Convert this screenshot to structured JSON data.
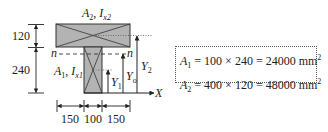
{
  "figure": {
    "title_top": {
      "A": "A",
      "A_sub": "2",
      "I": "I",
      "I_sub": "x2",
      "sep": ", "
    },
    "web_label": {
      "A": "A",
      "A_sub": "1",
      "I": "I",
      "I_sub": "x1",
      "sep": ", "
    },
    "neutral_axis_label": "n",
    "x_axis_label": "X",
    "y_labels": {
      "Y1": {
        "base": "Y",
        "sub": "1"
      },
      "Y0": {
        "base": "Y",
        "sub": "o"
      },
      "Y2": {
        "base": "Y",
        "sub": "2"
      }
    },
    "vertical_dimensions": [
      "120",
      "240"
    ],
    "horizontal_dimensions": [
      "150",
      "100",
      "150"
    ],
    "colors": {
      "fill": "#b3b3b3",
      "stroke": "#333333"
    }
  },
  "formulas": [
    {
      "lhs_base": "A",
      "lhs_sub": "1",
      "rhs": " = 100 × 240 = 24000 mm",
      "sup": "2"
    },
    {
      "lhs_base": "A",
      "lhs_sub": "2",
      "rhs": " = 400 × 120 = 48000 mm",
      "sup": "2"
    }
  ]
}
